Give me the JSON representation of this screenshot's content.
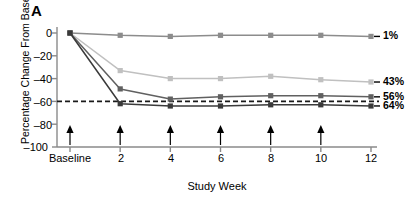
{
  "panel": {
    "label": "A"
  },
  "axes": {
    "ylabel": "Percentage Change From Baseline",
    "xlabel": "Study Week",
    "yticks": [
      "0",
      "–20",
      "–40",
      "–60",
      "–80",
      "–100"
    ],
    "xticks": [
      "Baseline",
      "2",
      "4",
      "6",
      "8",
      "10",
      "12"
    ]
  },
  "series_labels": {
    "s1": "1%",
    "s2": "43%",
    "s3": "56%",
    "s4": "64%"
  },
  "colors": {
    "s1": "#8c8c8c",
    "s2": "#c0c0c0",
    "s3": "#606060",
    "s4": "#3a3a3a",
    "axis": "#8a8a8a",
    "reference": "#1a1a1a",
    "arrow": "#000000"
  },
  "chart_data": {
    "type": "line",
    "title": "A",
    "xlabel": "Study Week",
    "ylabel": "Percentage Change From Baseline",
    "x": [
      0,
      2,
      4,
      6,
      8,
      10,
      12
    ],
    "xtick_labels": [
      "Baseline",
      "2",
      "4",
      "6",
      "8",
      "10",
      "12"
    ],
    "ylim": [
      -100,
      0
    ],
    "xlim": [
      0,
      12
    ],
    "yticks": [
      0,
      -20,
      -40,
      -60,
      -80,
      -100
    ],
    "grid": false,
    "legend_position": "right-inline",
    "reference_line": {
      "y": -60,
      "style": "dashed",
      "label": ""
    },
    "dosing_arrows": {
      "weeks": [
        0,
        2,
        4,
        6,
        8,
        10
      ],
      "symbol": "▲",
      "description": "upward arrows at baseline and weeks 2, 4, 6, 8, 10"
    },
    "series": [
      {
        "name": "1%",
        "values": [
          0,
          -2,
          -3,
          -2,
          -2,
          -2,
          -3
        ],
        "color": "#8c8c8c",
        "marker": "square"
      },
      {
        "name": "43%",
        "values": [
          0,
          -33,
          -40,
          -40,
          -38,
          -41,
          -43
        ],
        "color": "#c0c0c0",
        "marker": "square"
      },
      {
        "name": "56%",
        "values": [
          0,
          -49,
          -58,
          -56,
          -55,
          -55,
          -56
        ],
        "color": "#606060",
        "marker": "square"
      },
      {
        "name": "64%",
        "values": [
          0,
          -62,
          -64,
          -64,
          -63,
          -63,
          -64
        ],
        "color": "#3a3a3a",
        "marker": "square"
      }
    ]
  }
}
